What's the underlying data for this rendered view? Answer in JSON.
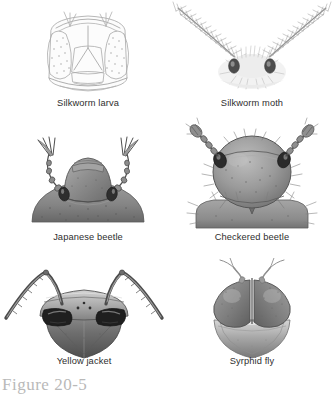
{
  "figure": {
    "caption": "Figure 20-5",
    "plate_title": "Insect head and antenna types"
  },
  "panels": [
    {
      "id": "silkworm-larva",
      "label": "Silkworm larva",
      "antenna_type": "short / inconspicuous",
      "style": "pale line drawing",
      "colors": {
        "outline": "#9a9a9a",
        "fill": "#fbfbfb"
      }
    },
    {
      "id": "silkworm-moth",
      "label": "Silkworm moth",
      "antenna_type": "plumose (feathery)",
      "style": "pale shaded drawing",
      "colors": {
        "outline": "#8e8e8e",
        "fill": "#f4f4f4",
        "eye": "#3a3a3a"
      }
    },
    {
      "id": "japanese-beetle",
      "label": "Japanese beetle",
      "antenna_type": "lamellate (plated club)",
      "style": "grayscale halftone",
      "colors": {
        "outline": "#4a4a4a",
        "fill": "#8f8f8f",
        "eye": "#2a2a2a"
      }
    },
    {
      "id": "checkered-beetle",
      "label": "Checkered beetle",
      "antenna_type": "capitate (clubbed)",
      "style": "grayscale halftone",
      "colors": {
        "outline": "#4a4a4a",
        "fill": "#989898",
        "eye": "#262626"
      }
    },
    {
      "id": "yellow-jacket",
      "label": "Yellow jacket",
      "antenna_type": "geniculate (elbowed)",
      "style": "grayscale halftone",
      "colors": {
        "outline": "#3c3c3c",
        "fill": "#8a8a8a",
        "eye": "#1f1f1f"
      }
    },
    {
      "id": "syrphid-fly",
      "label": "Syrphid fly",
      "antenna_type": "aristate (bristled)",
      "style": "grayscale halftone",
      "colors": {
        "outline": "#454545",
        "fill": "#8d8d8d",
        "eye": "#6f6f6f"
      }
    }
  ]
}
